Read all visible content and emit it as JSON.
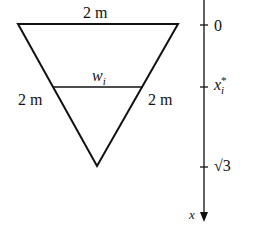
{
  "diagram": {
    "top_label": "2 m",
    "left_label": "2 m",
    "right_label": "2 m",
    "strip_label": "w",
    "strip_sub": "i",
    "axis": {
      "variable": "x",
      "ticks": [
        {
          "label": "0"
        },
        {
          "label": "x",
          "sub": "i",
          "sup": "*"
        },
        {
          "label": "√3"
        }
      ]
    }
  }
}
